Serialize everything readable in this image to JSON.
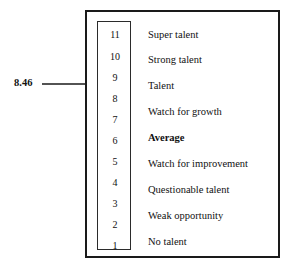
{
  "diagram": {
    "pointer": {
      "value": "8.46",
      "arrow_icon": "right-arrow-icon"
    },
    "scale": {
      "numbers": [
        "11",
        "10",
        "9",
        "8",
        "7",
        "6",
        "5",
        "4",
        "3",
        "2",
        "1"
      ],
      "min": 1,
      "max": 11
    },
    "levels": [
      {
        "label": "Super talent",
        "bold": false
      },
      {
        "label": "Strong talent",
        "bold": false
      },
      {
        "label": "Talent",
        "bold": false
      },
      {
        "label": "Watch for growth",
        "bold": false
      },
      {
        "label": "Average",
        "bold": true
      },
      {
        "label": "Watch for improvement",
        "bold": false
      },
      {
        "label": "Questionable talent",
        "bold": false
      },
      {
        "label": "Weak opportunity",
        "bold": false
      },
      {
        "label": "No talent",
        "bold": false
      }
    ],
    "colors": {
      "background": "#ffffff",
      "frame": "#1a1a1a",
      "inner_frame": "#2b2b2b",
      "text": "#111111"
    }
  }
}
